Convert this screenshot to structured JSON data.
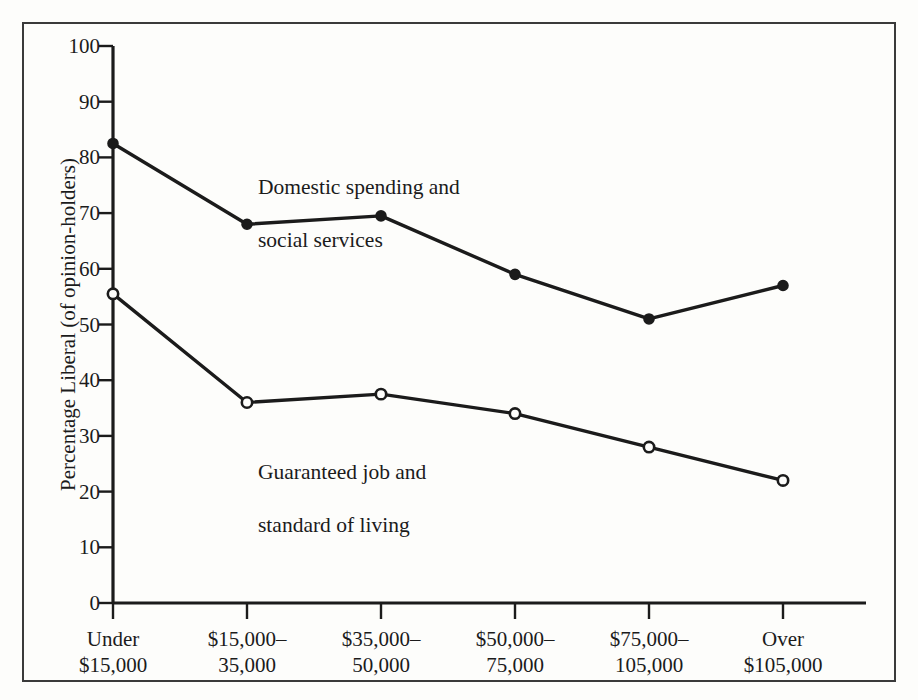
{
  "figure": {
    "background_color": "#fdfdfb",
    "ink_color": "#1b1b1b",
    "border_color": "#3a3a3a"
  },
  "chart_data": {
    "type": "line",
    "title": "",
    "subtitle": "",
    "xlabel": "",
    "ylabel": "Percentage Liberal (of opinion-holders)",
    "categories": [
      "Under\n$15,000",
      "$15,000–\n35,000",
      "$35,000–\n50,000",
      "$50,000–\n75,000",
      "$75,000–\n105,000",
      "Over\n$105,000"
    ],
    "category_lines": [
      [
        "Under",
        "$15,000"
      ],
      [
        "$15,000–",
        "35,000"
      ],
      [
        "$35,000–",
        "50,000"
      ],
      [
        "$50,000–",
        "75,000"
      ],
      [
        "$75,000–",
        "105,000"
      ],
      [
        "Over",
        "$105,000"
      ]
    ],
    "ylim": [
      0,
      100
    ],
    "ytick_values": [
      0,
      10,
      20,
      30,
      40,
      50,
      60,
      70,
      80,
      90,
      100
    ],
    "ytick_labels": [
      "0",
      "10",
      "20",
      "30",
      "40",
      "50",
      "60",
      "70",
      "80",
      "90",
      "100"
    ],
    "grid": false,
    "legend_position": "inline-annotation",
    "series": [
      {
        "name": "Domestic spending and social services",
        "name_lines": [
          "Domestic spending and",
          "social services"
        ],
        "marker": "filled-circle",
        "color": "#1b1b1b",
        "values": [
          82.5,
          68,
          69.5,
          59,
          51,
          57
        ]
      },
      {
        "name": "Guaranteed job and standard of living",
        "name_lines": [
          "Guaranteed job and",
          "standard of living"
        ],
        "marker": "open-circle",
        "color": "#1b1b1b",
        "values": [
          55.5,
          36,
          37.5,
          34,
          28,
          22
        ]
      }
    ]
  },
  "annotations": [
    {
      "id": "domestic-spending-label",
      "line1": "Domestic spending and",
      "line2": "social services"
    },
    {
      "id": "guaranteed-job-label",
      "line1": "Guaranteed job and",
      "line2": "standard of living"
    }
  ]
}
